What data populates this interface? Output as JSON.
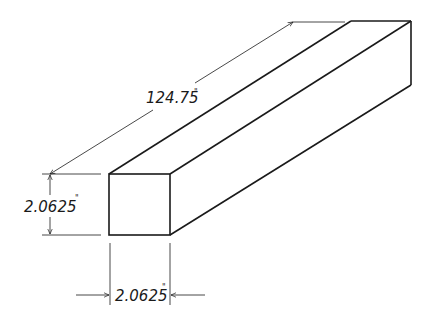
{
  "diagram": {
    "type": "isometric-dimensioned-bar",
    "object": "rectangular bar",
    "dimensions": {
      "length": {
        "value": "124.75",
        "unit": "\""
      },
      "height": {
        "value": "2.0625",
        "unit": "\""
      },
      "width": {
        "value": "2.0625",
        "unit": "\""
      }
    },
    "colors": {
      "line": "#1a1a1a",
      "background": "#ffffff"
    }
  }
}
